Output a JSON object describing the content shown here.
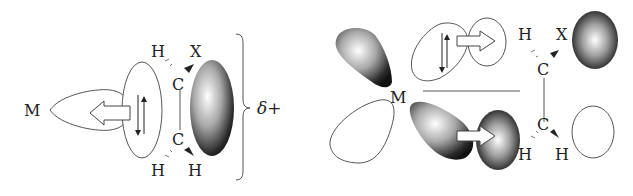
{
  "left_panel": {
    "metal": "M",
    "h_top_left": "H",
    "x_top_right": "X",
    "c_top": "C",
    "c_bottom": "C",
    "h_bottom_left": "H",
    "h_bottom_right": "H",
    "charge": "δ+"
  },
  "right_panel": {
    "metal": "M",
    "h_top_left": "H",
    "x_top_right": "X",
    "c_top": "C",
    "c_bottom": "C",
    "h_bottom_left": "H",
    "h_bottom_right": "H"
  },
  "colors": {
    "line": "#555555",
    "text": "#222222",
    "shade_dark": "#111111",
    "shade_light": "#ffffff"
  }
}
